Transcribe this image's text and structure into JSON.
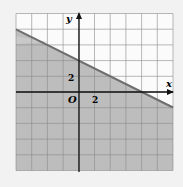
{
  "chart_data": {
    "type": "area",
    "title": "",
    "xlabel": "x",
    "ylabel": "y",
    "origin_label": "O",
    "tick_labels": {
      "x": [
        "2"
      ],
      "y": [
        "2"
      ]
    },
    "grid": true,
    "units_per_cell": 2,
    "xlim": [
      -8,
      12
    ],
    "ylim": [
      -10,
      10
    ],
    "boundary_line": {
      "slope": -0.5,
      "intercept": 4,
      "equation": "y = -x/2 + 4",
      "style": "solid"
    },
    "shaded_region": "below",
    "points": [
      {
        "x": -8,
        "y": 8
      },
      {
        "x": 0,
        "y": 4
      },
      {
        "x": 8,
        "y": 0
      },
      {
        "x": 12,
        "y": -2
      }
    ]
  },
  "colors": {
    "shade": "#bdbdbd",
    "grid": "#8a8a8a",
    "line": "#6e6e6e",
    "axis": "#111111",
    "background": "#f7f7f7"
  }
}
